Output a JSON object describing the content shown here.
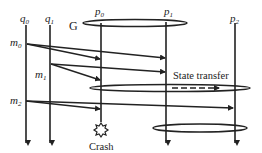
{
  "figure": {
    "group_label": "G",
    "state_transfer_label": "State transfer",
    "crash_label": "Crash",
    "processes": [
      {
        "id": "q0",
        "base": "q",
        "sub": "0"
      },
      {
        "id": "q1",
        "base": "q",
        "sub": "1"
      },
      {
        "id": "p0",
        "base": "p",
        "sub": "0"
      },
      {
        "id": "p1",
        "base": "p",
        "sub": "1"
      },
      {
        "id": "p2",
        "base": "p",
        "sub": "2"
      }
    ],
    "messages": [
      {
        "id": "m0",
        "base": "m",
        "sub": "0",
        "from": "q0",
        "to": [
          "p0",
          "p1"
        ]
      },
      {
        "id": "m1",
        "base": "m",
        "sub": "1",
        "from": "q1",
        "to": [
          "p0",
          "p1"
        ]
      },
      {
        "id": "m2",
        "base": "m",
        "sub": "2",
        "from": "q0",
        "to": [
          "p0",
          "p2"
        ]
      }
    ],
    "colors": {
      "line": "#222222",
      "background": "#ffffff"
    }
  }
}
